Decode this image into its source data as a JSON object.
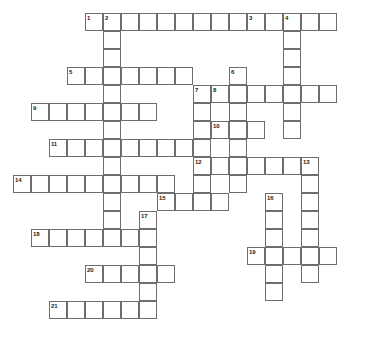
{
  "puzzle": {
    "kind": "crossword-grid",
    "title": "",
    "cell_size": 18,
    "grid_origin": {
      "x": 13,
      "y": 13
    },
    "colors": {
      "cell_border": "#6e6e72",
      "cell_fill": "#ffffff",
      "number_text": "#1a1a1a",
      "page_background": "#ffffff"
    },
    "entries": [
      {
        "number": "1",
        "direction": "across",
        "col": 4,
        "row": 0,
        "length": 9
      },
      {
        "number": "2",
        "direction": "down",
        "col": 5,
        "row": 0,
        "length": 13
      },
      {
        "number": "3",
        "direction": "across",
        "col": 13,
        "row": 0,
        "length": 5
      },
      {
        "number": "4",
        "direction": "down",
        "col": 15,
        "row": 0,
        "length": 7
      },
      {
        "number": "5",
        "direction": "across",
        "col": 3,
        "row": 3,
        "length": 7
      },
      {
        "number": "6",
        "direction": "down",
        "col": 12,
        "row": 3,
        "length": 7
      },
      {
        "number": "7",
        "direction": "down",
        "col": 10,
        "row": 4,
        "length": 7
      },
      {
        "number": "8",
        "direction": "across",
        "col": 11,
        "row": 4,
        "length": 7
      },
      {
        "number": "9",
        "direction": "across",
        "col": 1,
        "row": 5,
        "length": 7
      },
      {
        "number": "10",
        "direction": "across",
        "col": 11,
        "row": 6,
        "length": 3
      },
      {
        "number": "11",
        "direction": "across",
        "col": 2,
        "row": 7,
        "length": 8
      },
      {
        "number": "12",
        "direction": "across",
        "col": 10,
        "row": 8,
        "length": 7
      },
      {
        "number": "13",
        "direction": "down",
        "col": 16,
        "row": 8,
        "length": 7
      },
      {
        "number": "14",
        "direction": "across",
        "col": 0,
        "row": 9,
        "length": 9
      },
      {
        "number": "15",
        "direction": "across",
        "col": 8,
        "row": 10,
        "length": 4
      },
      {
        "number": "16",
        "direction": "down",
        "col": 14,
        "row": 10,
        "length": 6
      },
      {
        "number": "17",
        "direction": "down",
        "col": 7,
        "row": 11,
        "length": 6
      },
      {
        "number": "18",
        "direction": "across",
        "col": 1,
        "row": 12,
        "length": 7
      },
      {
        "number": "19",
        "direction": "across",
        "col": 13,
        "row": 13,
        "length": 5
      },
      {
        "number": "20",
        "direction": "across",
        "col": 4,
        "row": 14,
        "length": 5
      },
      {
        "number": "21",
        "direction": "across",
        "col": 2,
        "row": 16,
        "length": 6
      }
    ]
  }
}
